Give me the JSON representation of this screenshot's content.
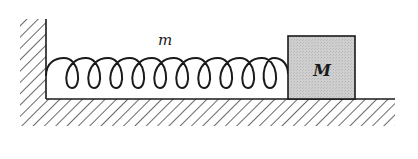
{
  "diagram": {
    "spring": {
      "label": "m",
      "loops": 10,
      "color": "#1a1a1a"
    },
    "block": {
      "label": "M",
      "fill": "#c9c9c9",
      "stroke": "#1a1a1a"
    },
    "wall": {
      "hatch_color": "#444444"
    },
    "floor": {
      "hatch_color": "#444444"
    }
  }
}
